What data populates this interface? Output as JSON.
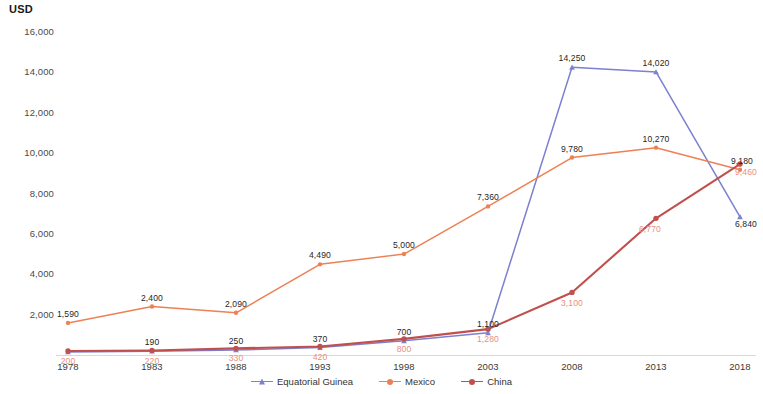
{
  "chart_data": {
    "type": "line",
    "title": "",
    "subtitle": "",
    "xlabel": "",
    "ylabel": "USD",
    "ylim": [
      0,
      16000
    ],
    "ytick_labels": [
      "16,000",
      "14,000",
      "12,000",
      "10,000",
      "8,000",
      "6,000",
      "4,000",
      "2,000"
    ],
    "ytick_values": [
      16000,
      14000,
      12000,
      10000,
      8000,
      6000,
      4000,
      2000
    ],
    "grid": false,
    "legend_position": "bottom",
    "categories": [
      "1978",
      "1983",
      "1988",
      "1993",
      "1998",
      "2003",
      "2008",
      "2013",
      "2018"
    ],
    "x": [
      1978,
      1983,
      1988,
      1993,
      1998,
      2003,
      2008,
      2013,
      2018
    ],
    "series": [
      {
        "name": "Equatorial Guinea",
        "color": "#7b81cf",
        "marker": "triangle",
        "values": [
          150,
          190,
          250,
          370,
          700,
          1100,
          14250,
          14020,
          6840
        ],
        "point_labels": [
          "",
          "190",
          "250",
          "370",
          "700",
          "1,100",
          "14,250",
          "14,020",
          "6,840"
        ]
      },
      {
        "name": "Mexico",
        "color": "#ed8155",
        "marker": "circle",
        "values": [
          1590,
          2400,
          2090,
          4490,
          5000,
          7360,
          9780,
          10270,
          9180
        ],
        "point_labels": [
          "1,590",
          "2,400",
          "2,090",
          "4,490",
          "5,000",
          "7,360",
          "9,780",
          "10,270",
          "9,180"
        ]
      },
      {
        "name": "China",
        "color": "#c0504d",
        "marker": "circle",
        "values": [
          200,
          220,
          330,
          420,
          800,
          1280,
          3100,
          6770,
          9460
        ],
        "point_labels": [
          "200",
          "220",
          "330",
          "420",
          "800",
          "1,280",
          "3,100",
          "6,770",
          "9,460"
        ]
      }
    ]
  },
  "axis": {
    "y_title": "USD"
  },
  "legend": {
    "items": [
      {
        "label": "Equatorial Guinea"
      },
      {
        "label": "Mexico"
      },
      {
        "label": "China"
      }
    ]
  }
}
